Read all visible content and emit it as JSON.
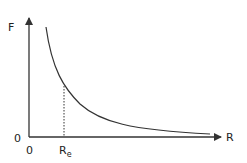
{
  "diagram": {
    "type": "force-vs-distance curve",
    "y_axis_label": "F",
    "x_axis_label": "R",
    "y_origin_label": "0",
    "x_origin_label": "0",
    "marker_label_main": "R",
    "marker_label_sub": "e",
    "colors": {
      "line": "#333333",
      "background": "#ffffff"
    }
  }
}
